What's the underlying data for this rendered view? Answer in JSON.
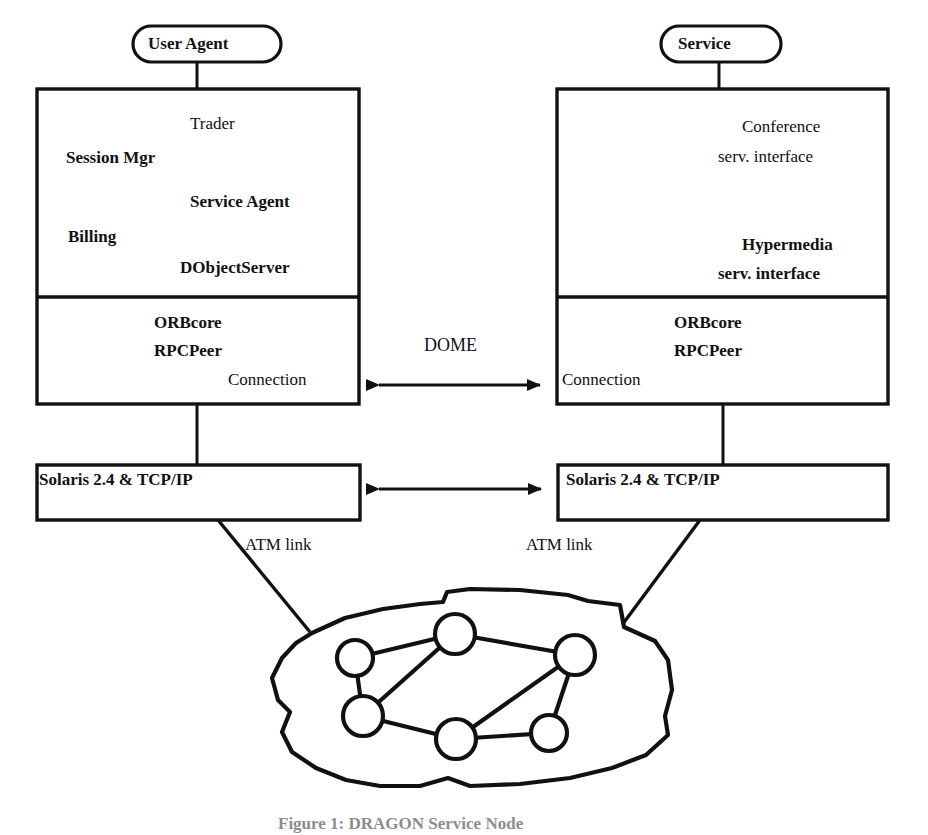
{
  "figure": {
    "caption": "Figure 1: DRAGON Service Node"
  },
  "left_node": {
    "title": "User Agent",
    "application_layer": {
      "components": [
        "Trader",
        "Session Mgr",
        "Service Agent",
        "Billing",
        "DObjectServer"
      ]
    },
    "middleware_layer": {
      "components": [
        "ORBcore",
        "RPCPeer",
        "Connection"
      ]
    },
    "os_layer": {
      "label": "Solaris 2.4 & TCP/IP"
    },
    "network_link": {
      "label": "ATM link"
    }
  },
  "right_node": {
    "title": "Service",
    "application_layer": {
      "components": [
        "Conference",
        "serv. interface",
        "Hypermedia",
        "serv. interface"
      ]
    },
    "middleware_layer": {
      "components": [
        "ORBcore",
        "RPCPeer",
        "Connection"
      ]
    },
    "os_layer": {
      "label": "Solaris 2.4 & TCP/IP"
    },
    "network_link": {
      "label": "ATM link"
    }
  },
  "interconnect": {
    "middleware_protocol_label": "DOME"
  },
  "cloud": {
    "node_count": 6,
    "link_count": 8
  },
  "colors": {
    "ink": "#111111",
    "stroke": "#1a1a1a",
    "background": "#ffffff",
    "caption_ink": "#8d8d8d"
  }
}
